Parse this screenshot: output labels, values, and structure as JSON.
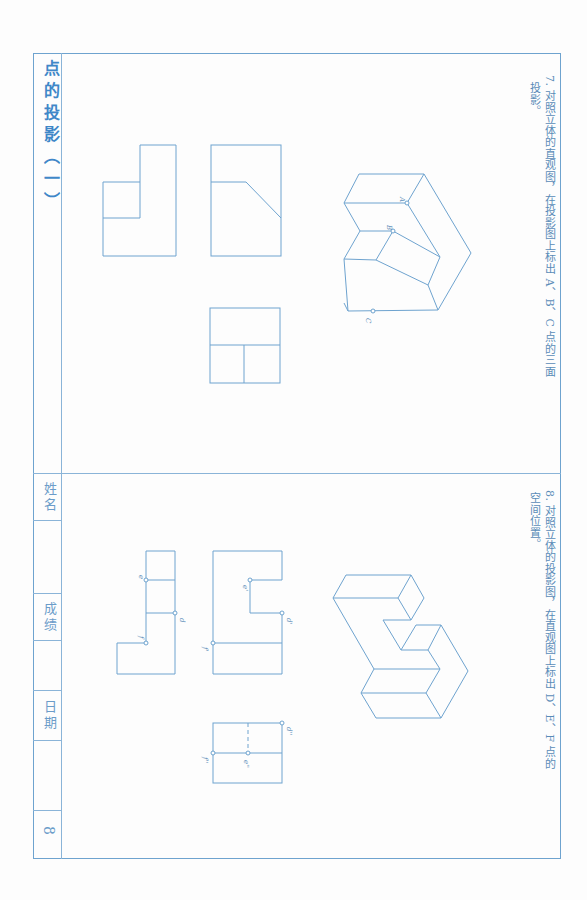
{
  "page": {
    "title": "点的投影（一）",
    "page_number": "8",
    "footer_fields": [
      {
        "label": "姓名",
        "value": ""
      },
      {
        "label": "成绩",
        "value": ""
      },
      {
        "label": "日期",
        "value": ""
      }
    ],
    "line_color": "#6ea3cf",
    "title_color": "#3f87c8"
  },
  "questions": [
    {
      "number": "7.",
      "text": "对照立体的直观图，在投影图上标出 A、B、C 点的三面投影。",
      "line1": "7. 对照立体的直观图，在投影图上标出 A、B、C 点的三面",
      "line2": "投影。",
      "pictorial_labels": [
        "A",
        "B",
        "C"
      ]
    },
    {
      "number": "8.",
      "text": "对照立体的投影图，在直观图上标出 D、E、F 点的空间位置。",
      "line1": "8. 对照立体的投影图，在直观图上标出 D、E、F 点的",
      "line2": "空间位置。",
      "projection_labels": [
        "e",
        "d",
        "f",
        "e'",
        "d'",
        "f'",
        "d''",
        "e''",
        "f''"
      ]
    }
  ]
}
